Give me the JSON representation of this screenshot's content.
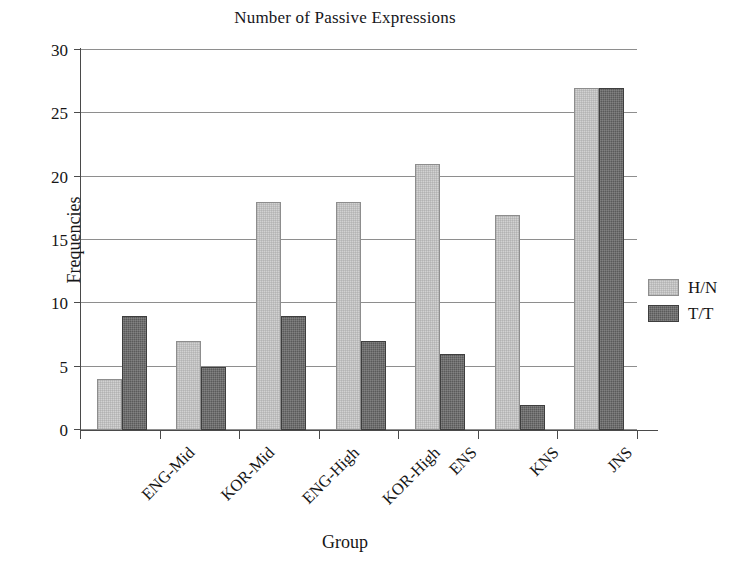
{
  "chart_data": {
    "type": "bar",
    "title": "Number of Passive Expressions",
    "xlabel": "Group",
    "ylabel": "Frequencies",
    "categories": [
      "ENG-Mid",
      "KOR-Mid",
      "ENG-High",
      "KOR-High",
      "ENS",
      "KNS",
      "JNS"
    ],
    "series": [
      {
        "name": "H/N",
        "values": [
          4,
          7,
          18,
          18,
          21,
          17,
          27
        ],
        "color": "#d2d2d2"
      },
      {
        "name": "T/T",
        "values": [
          9,
          5,
          9,
          7,
          6,
          2,
          27
        ],
        "color": "#5a5a5a"
      }
    ],
    "ylim": [
      0,
      30
    ],
    "yticks": [
      0,
      5,
      10,
      15,
      20,
      25,
      30
    ],
    "ytick_labels": [
      "0",
      "5",
      "10",
      "15",
      "20",
      "25",
      "30"
    ],
    "grid": true,
    "grid_axis": "y",
    "legend_position": "right",
    "xtick_label_rotation": -45
  }
}
